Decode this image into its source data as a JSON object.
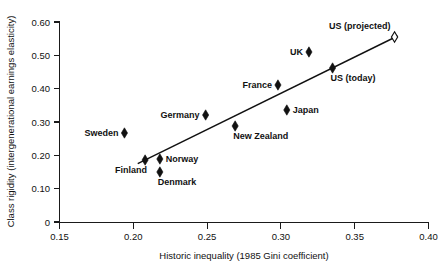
{
  "chart_data": {
    "type": "scatter",
    "title": "",
    "xlabel": "Historic inequality (1985 Gini coefficient)",
    "ylabel": "Class rigidity (intergenerational earnings elasticity)",
    "xlim": [
      0.15,
      0.4
    ],
    "ylim": [
      0.0,
      0.6
    ],
    "xticks": [
      "0.15",
      "0.20",
      "0.25",
      "0.30",
      "0.35",
      "0.40"
    ],
    "xtick_values": [
      0.15,
      0.2,
      0.25,
      0.3,
      0.35,
      0.4
    ],
    "yticks": [
      "0",
      "0.10",
      "0.20",
      "0.30",
      "0.40",
      "0.50",
      "0.60"
    ],
    "ytick_values": [
      0,
      0.1,
      0.2,
      0.3,
      0.4,
      0.5,
      0.6
    ],
    "grid": false,
    "legend": "none",
    "points": [
      {
        "label": "Sweden",
        "x": 0.194,
        "y": 0.267,
        "marker": "filled-diamond",
        "label_pos": "left"
      },
      {
        "label": "Finland",
        "x": 0.208,
        "y": 0.186,
        "marker": "filled-diamond",
        "label_pos": "below-left"
      },
      {
        "label": "Denmark",
        "x": 0.218,
        "y": 0.15,
        "marker": "filled-diamond",
        "label_pos": "below-right"
      },
      {
        "label": "Norway",
        "x": 0.218,
        "y": 0.189,
        "marker": "filled-diamond",
        "label_pos": "right"
      },
      {
        "label": "Germany",
        "x": 0.249,
        "y": 0.321,
        "marker": "filled-diamond",
        "label_pos": "left"
      },
      {
        "label": "New Zealand",
        "x": 0.269,
        "y": 0.288,
        "marker": "filled-diamond",
        "label_pos": "below-right"
      },
      {
        "label": "France",
        "x": 0.298,
        "y": 0.411,
        "marker": "filled-diamond",
        "label_pos": "left"
      },
      {
        "label": "Japan",
        "x": 0.304,
        "y": 0.336,
        "marker": "filled-diamond",
        "label_pos": "right"
      },
      {
        "label": "UK",
        "x": 0.319,
        "y": 0.51,
        "marker": "filled-diamond",
        "label_pos": "left"
      },
      {
        "label": "US (today)",
        "x": 0.335,
        "y": 0.462,
        "marker": "filled-diamond",
        "label_pos": "below-right"
      },
      {
        "label": "US (projected)",
        "x": 0.377,
        "y": 0.555,
        "marker": "hollow-diamond",
        "label_pos": "above-left"
      }
    ],
    "trendline": {
      "x0": 0.203,
      "y0": 0.175,
      "x1": 0.379,
      "y1": 0.558
    }
  }
}
